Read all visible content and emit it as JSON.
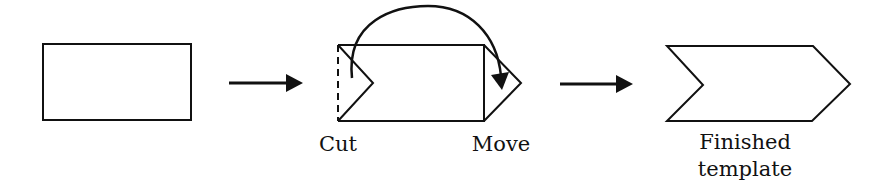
{
  "diagram": {
    "steps": [
      {
        "id": "original-rectangle",
        "label": ""
      },
      {
        "id": "cut-and-move",
        "labels": {
          "cut": "Cut",
          "move": "Move"
        }
      },
      {
        "id": "finished-template",
        "label_line1": "Finished",
        "label_line2": "template"
      }
    ],
    "arrows": [
      "step1-to-step2",
      "step2-to-step3"
    ],
    "colors": {
      "stroke": "#111111",
      "background": "#ffffff"
    }
  }
}
